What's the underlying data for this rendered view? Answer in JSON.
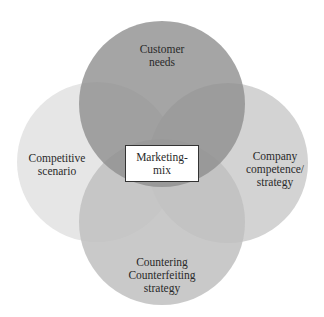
{
  "diagram": {
    "type": "venn",
    "center": {
      "lines": [
        "Marketing-",
        "mix"
      ]
    },
    "circles": [
      {
        "id": "top",
        "lines": [
          "Customer",
          "needs"
        ],
        "color": "#a3a3a3"
      },
      {
        "id": "left",
        "lines": [
          "Competitive",
          "scenario"
        ],
        "color": "#e6e6e6"
      },
      {
        "id": "right",
        "lines": [
          "Company",
          "competence/",
          "strategy"
        ],
        "color": "#d2d2d2"
      },
      {
        "id": "bottom",
        "lines": [
          "Countering",
          "Counterfeiting",
          "strategy"
        ],
        "color": "#c4c4c4"
      }
    ]
  }
}
